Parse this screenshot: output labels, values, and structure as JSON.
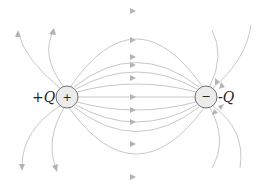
{
  "diagram": {
    "positive_charge": {
      "label": "+Q",
      "sign": "+",
      "cx": 67,
      "cy": 97,
      "r": 11
    },
    "negative_charge": {
      "label": "-Q",
      "sign": "−",
      "cx": 206,
      "cy": 97,
      "r": 11
    },
    "colors": {
      "field_line": "#c8c8c8",
      "arrow": "#b4b4b4",
      "charge_fill": "#ececec",
      "charge_stroke": "#707070"
    }
  }
}
